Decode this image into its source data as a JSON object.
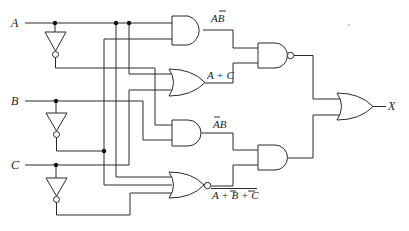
{
  "diagram": {
    "type": "logic-circuit",
    "inputs": [
      {
        "name": "A",
        "label": "A"
      },
      {
        "name": "B",
        "label": "B"
      },
      {
        "name": "C",
        "label": "C"
      }
    ],
    "output": {
      "name": "X",
      "label": "X"
    },
    "gates": [
      {
        "id": "inv_a",
        "type": "NOT",
        "input": "A",
        "output": "A'"
      },
      {
        "id": "inv_b",
        "type": "NOT",
        "input": "B",
        "output": "B'"
      },
      {
        "id": "inv_c",
        "type": "NOT",
        "input": "C",
        "output": "C'"
      },
      {
        "id": "and1",
        "type": "AND",
        "inputs": [
          "A",
          "B'"
        ],
        "output_label": "AB̄"
      },
      {
        "id": "or1",
        "type": "OR",
        "inputs": [
          "A",
          "C"
        ],
        "output_label": "A + C"
      },
      {
        "id": "and2",
        "type": "AND",
        "inputs": [
          "A'",
          "B"
        ],
        "output_label": "ĀB"
      },
      {
        "id": "nor1",
        "type": "NOR",
        "inputs": [
          "A",
          "B'",
          "C'"
        ],
        "output_label": "A + B̄ + C̄ (overlined)"
      },
      {
        "id": "nand1",
        "type": "NAND",
        "inputs": [
          "and1",
          "or1"
        ]
      },
      {
        "id": "and3",
        "type": "AND",
        "inputs": [
          "and2",
          "nor1"
        ]
      },
      {
        "id": "or_out",
        "type": "OR",
        "inputs": [
          "nand1",
          "and3"
        ],
        "output": "X"
      }
    ],
    "labels": {
      "a_bbar": "AB",
      "a_plus_c": "A + C",
      "abar_b": "AB",
      "nor_expr_a": "A + ",
      "nor_expr_b": "B",
      "nor_expr_plus": " + ",
      "nor_expr_c": "C"
    }
  }
}
